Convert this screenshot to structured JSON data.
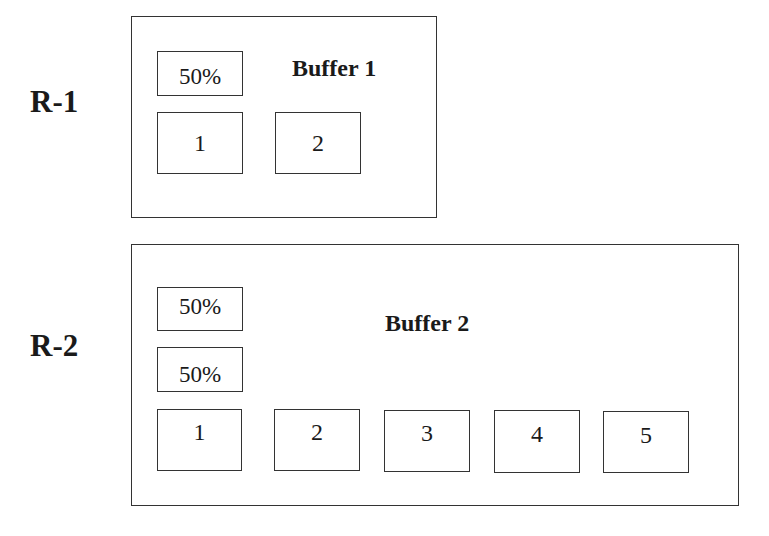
{
  "rows": [
    {
      "label": "R-1",
      "buffer_title": "Buffer 1",
      "percent_boxes": [
        "50%"
      ],
      "slots": [
        "1",
        "2"
      ]
    },
    {
      "label": "R-2",
      "buffer_title": "Buffer 2",
      "percent_boxes": [
        "50%",
        "50%"
      ],
      "slots": [
        "1",
        "2",
        "3",
        "4",
        "5"
      ]
    }
  ],
  "colors": {
    "stroke": "#333333",
    "text": "#1a1a1a",
    "background": "#ffffff"
  }
}
